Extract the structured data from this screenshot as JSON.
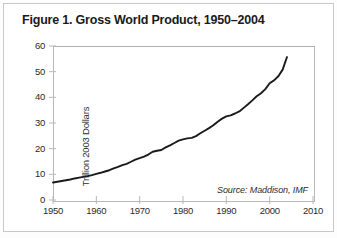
{
  "figure": {
    "title": "Figure 1. Gross World Product, 1950–2004",
    "source_note": "Source: Maddison, IMF"
  },
  "colors": {
    "line": "#1a1a1a",
    "axis": "#b8b8b8",
    "text": "#2b2b2b",
    "frame": "#c9c9c9",
    "background": "#ffffff"
  },
  "chart_data": {
    "type": "line",
    "title": "Figure 1. Gross World Product, 1950–2004",
    "xlabel": "",
    "ylabel": "Trillion 2003 Dollars",
    "xlim": [
      1950,
      2010
    ],
    "ylim": [
      0,
      60
    ],
    "xticks": [
      1950,
      1960,
      1970,
      1980,
      1990,
      2000,
      2010
    ],
    "yticks": [
      0,
      10,
      20,
      30,
      40,
      50,
      60
    ],
    "xtick_labels": [
      "1950",
      "1960",
      "1970",
      "1980",
      "1990",
      "2000",
      "2010"
    ],
    "ytick_labels": [
      "0",
      "10",
      "20",
      "30",
      "40",
      "50",
      "60"
    ],
    "grid": false,
    "legend": null,
    "annotations": [
      "Source: Maddison, IMF"
    ],
    "series": [
      {
        "name": "Gross World Product",
        "units": "Trillion 2003 Dollars",
        "x": [
          1950,
          1951,
          1952,
          1953,
          1954,
          1955,
          1956,
          1957,
          1958,
          1959,
          1960,
          1961,
          1962,
          1963,
          1964,
          1965,
          1966,
          1967,
          1968,
          1969,
          1970,
          1971,
          1972,
          1973,
          1974,
          1975,
          1976,
          1977,
          1978,
          1979,
          1980,
          1981,
          1982,
          1983,
          1984,
          1985,
          1986,
          1987,
          1988,
          1989,
          1990,
          1991,
          1992,
          1993,
          1994,
          1995,
          1996,
          1997,
          1998,
          1999,
          2000,
          2001,
          2002,
          2003,
          2004
        ],
        "values": [
          6.8,
          7.1,
          7.4,
          7.7,
          8.0,
          8.4,
          8.7,
          9.0,
          9.3,
          9.7,
          10.2,
          10.6,
          11.1,
          11.6,
          12.3,
          12.9,
          13.6,
          14.1,
          14.9,
          15.7,
          16.3,
          16.9,
          17.7,
          18.8,
          19.2,
          19.5,
          20.5,
          21.3,
          22.2,
          23.1,
          23.6,
          24.0,
          24.2,
          24.9,
          26.0,
          27.0,
          28.0,
          29.1,
          30.5,
          31.7,
          32.6,
          33.0,
          33.7,
          34.5,
          35.9,
          37.3,
          38.8,
          40.4,
          41.6,
          43.2,
          45.5,
          46.6,
          48.2,
          50.8,
          55.7
        ]
      }
    ]
  },
  "axes_geometry": {
    "plot_left_px": 53,
    "plot_top_px": 46,
    "plot_width_px": 260,
    "plot_height_px": 154
  }
}
